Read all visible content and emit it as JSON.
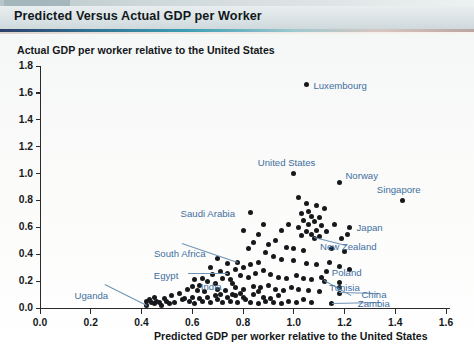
{
  "figure": {
    "strip_tag": "FIGURE 8.4",
    "title": "Predicted Versus Actual GDP per Worker"
  },
  "colors": {
    "title_bar": "#dde5e7",
    "rule_accent": "#3e9fb5",
    "dot": "#16181b",
    "annotation": "#3f6f9f",
    "axis": "#2b2b2b"
  },
  "chart_data": {
    "type": "scatter",
    "title": "Predicted Versus Actual GDP per Worker",
    "xlabel": "Predicted GDP per worker relative to the United States",
    "ylabel": "Actual GDP per worker relative to the United States",
    "xlim": [
      0.0,
      1.6
    ],
    "ylim": [
      0.0,
      1.8
    ],
    "xticks": [
      "0.0",
      "0.2",
      "0.4",
      "0.6",
      "0.8",
      "1.0",
      "1.2",
      "1.4",
      "1.6"
    ],
    "yticks": [
      "0.0",
      "0.2",
      "0.4",
      "0.6",
      "0.8",
      "1.0",
      "1.2",
      "1.4",
      "1.6",
      "1.8"
    ],
    "grid": false,
    "legend": null,
    "labeled_points": [
      {
        "name": "Luxembourg",
        "x": 1.05,
        "y": 1.66,
        "label_dx": 7,
        "label_dy": -5,
        "anchor": "left"
      },
      {
        "name": "United States",
        "x": 1.0,
        "y": 1.0,
        "label_dx": -36,
        "label_dy": -17,
        "anchor": "left"
      },
      {
        "name": "Norway",
        "x": 1.18,
        "y": 0.93,
        "label_dx": 6,
        "label_dy": -13,
        "anchor": "left"
      },
      {
        "name": "Singapore",
        "x": 1.43,
        "y": 0.8,
        "label_dx": -26,
        "label_dy": -16,
        "anchor": "left"
      },
      {
        "name": "Japan",
        "x": 1.22,
        "y": 0.6,
        "label_dx": 7,
        "label_dy": -5,
        "anchor": "left"
      },
      {
        "name": "New Zealand",
        "x": 1.08,
        "y": 0.52,
        "label_dx": 6,
        "label_dy": 3,
        "anchor": "left"
      },
      {
        "name": "Saudi Arabia",
        "x": 0.83,
        "y": 0.71,
        "label_dx": -70,
        "label_dy": -5,
        "anchor": "left"
      },
      {
        "name": "South Africa",
        "x": 0.78,
        "y": 0.34,
        "label_dx": -84,
        "label_dy": -14,
        "anchor": "left"
      },
      {
        "name": "Egypt",
        "x": 0.74,
        "y": 0.26,
        "label_dx": -74,
        "label_dy": -3,
        "anchor": "left"
      },
      {
        "name": "India",
        "x": 0.76,
        "y": 0.18,
        "label_dx": -32,
        "label_dy": -3,
        "anchor": "left"
      },
      {
        "name": "Poland",
        "x": 1.13,
        "y": 0.27,
        "label_dx": 5,
        "label_dy": -5,
        "anchor": "left"
      },
      {
        "name": "Tunisia",
        "x": 1.12,
        "y": 0.2,
        "label_dx": 5,
        "label_dy": 1,
        "anchor": "left"
      },
      {
        "name": "China",
        "x": 1.18,
        "y": 0.11,
        "label_dx": 22,
        "label_dy": -4,
        "anchor": "left"
      },
      {
        "name": "Zambia",
        "x": 1.15,
        "y": 0.03,
        "label_dx": 26,
        "label_dy": -6,
        "anchor": "left"
      },
      {
        "name": "Uganda",
        "x": 0.42,
        "y": 0.02,
        "label_dx": -72,
        "label_dy": -15,
        "anchor": "left"
      }
    ],
    "points": [
      [
        1.05,
        1.66
      ],
      [
        1.0,
        1.0
      ],
      [
        1.18,
        0.93
      ],
      [
        1.43,
        0.8
      ],
      [
        1.22,
        0.6
      ],
      [
        1.08,
        0.52
      ],
      [
        0.83,
        0.71
      ],
      [
        0.78,
        0.34
      ],
      [
        0.74,
        0.26
      ],
      [
        0.76,
        0.18
      ],
      [
        1.13,
        0.27
      ],
      [
        1.12,
        0.2
      ],
      [
        1.18,
        0.11
      ],
      [
        1.15,
        0.03
      ],
      [
        0.42,
        0.02
      ],
      [
        1.02,
        0.82
      ],
      [
        1.05,
        0.78
      ],
      [
        1.09,
        0.76
      ],
      [
        1.12,
        0.74
      ],
      [
        1.06,
        0.72
      ],
      [
        1.03,
        0.7
      ],
      [
        1.07,
        0.68
      ],
      [
        1.1,
        0.67
      ],
      [
        1.04,
        0.65
      ],
      [
        1.08,
        0.64
      ],
      [
        1.06,
        0.62
      ],
      [
        1.11,
        0.61
      ],
      [
        1.02,
        0.6
      ],
      [
        1.09,
        0.58
      ],
      [
        1.05,
        0.57
      ],
      [
        1.13,
        0.57
      ],
      [
        1.07,
        0.55
      ],
      [
        1.03,
        0.54
      ],
      [
        1.1,
        0.53
      ],
      [
        1.16,
        0.62
      ],
      [
        1.21,
        0.55
      ],
      [
        1.19,
        0.52
      ],
      [
        0.98,
        0.62
      ],
      [
        0.95,
        0.58
      ],
      [
        0.93,
        0.5
      ],
      [
        0.9,
        0.47
      ],
      [
        0.97,
        0.45
      ],
      [
        1.0,
        0.44
      ],
      [
        1.04,
        0.43
      ],
      [
        1.15,
        0.44
      ],
      [
        1.2,
        0.42
      ],
      [
        0.88,
        0.62
      ],
      [
        0.86,
        0.55
      ],
      [
        0.84,
        0.49
      ],
      [
        0.82,
        0.44
      ],
      [
        0.8,
        0.58
      ],
      [
        0.89,
        0.41
      ],
      [
        0.92,
        0.38
      ],
      [
        0.95,
        0.36
      ],
      [
        1.0,
        0.35
      ],
      [
        1.05,
        0.33
      ],
      [
        1.09,
        0.32
      ],
      [
        1.14,
        0.34
      ],
      [
        1.18,
        0.31
      ],
      [
        1.22,
        0.29
      ],
      [
        0.86,
        0.34
      ],
      [
        0.83,
        0.32
      ],
      [
        0.8,
        0.3
      ],
      [
        0.77,
        0.29
      ],
      [
        0.74,
        0.33
      ],
      [
        0.71,
        0.27
      ],
      [
        0.68,
        0.25
      ],
      [
        0.72,
        0.22
      ],
      [
        0.75,
        0.21
      ],
      [
        0.79,
        0.24
      ],
      [
        0.82,
        0.23
      ],
      [
        0.85,
        0.26
      ],
      [
        0.88,
        0.28
      ],
      [
        0.91,
        0.25
      ],
      [
        0.94,
        0.23
      ],
      [
        0.97,
        0.22
      ],
      [
        1.01,
        0.24
      ],
      [
        1.04,
        0.22
      ],
      [
        1.07,
        0.21
      ],
      [
        1.11,
        0.23
      ],
      [
        0.66,
        0.2
      ],
      [
        0.69,
        0.18
      ],
      [
        0.63,
        0.17
      ],
      [
        0.6,
        0.16
      ],
      [
        0.58,
        0.14
      ],
      [
        0.62,
        0.13
      ],
      [
        0.65,
        0.12
      ],
      [
        0.7,
        0.14
      ],
      [
        0.73,
        0.13
      ],
      [
        0.77,
        0.15
      ],
      [
        0.8,
        0.14
      ],
      [
        0.84,
        0.16
      ],
      [
        0.87,
        0.15
      ],
      [
        0.9,
        0.17
      ],
      [
        0.93,
        0.14
      ],
      [
        0.96,
        0.13
      ],
      [
        0.99,
        0.15
      ],
      [
        1.02,
        0.14
      ],
      [
        1.06,
        0.13
      ],
      [
        1.1,
        0.12
      ],
      [
        1.18,
        0.15
      ],
      [
        1.18,
        0.19
      ],
      [
        0.55,
        0.11
      ],
      [
        0.52,
        0.09
      ],
      [
        0.49,
        0.07
      ],
      [
        0.46,
        0.05
      ],
      [
        0.44,
        0.04
      ],
      [
        0.43,
        0.06
      ],
      [
        0.45,
        0.03
      ],
      [
        0.47,
        0.04
      ],
      [
        0.5,
        0.05
      ],
      [
        0.53,
        0.04
      ],
      [
        0.56,
        0.06
      ],
      [
        0.59,
        0.05
      ],
      [
        0.61,
        0.03
      ],
      [
        0.64,
        0.05
      ],
      [
        0.67,
        0.04
      ],
      [
        0.7,
        0.06
      ],
      [
        0.72,
        0.04
      ],
      [
        0.75,
        0.05
      ],
      [
        0.78,
        0.04
      ],
      [
        0.81,
        0.06
      ],
      [
        0.83,
        0.04
      ],
      [
        0.86,
        0.03
      ],
      [
        0.89,
        0.05
      ],
      [
        0.92,
        0.04
      ],
      [
        0.95,
        0.03
      ],
      [
        0.98,
        0.05
      ],
      [
        1.01,
        0.04
      ],
      [
        1.04,
        0.06
      ],
      [
        1.07,
        0.04
      ],
      [
        0.66,
        0.08
      ],
      [
        0.69,
        0.09
      ],
      [
        0.63,
        0.07
      ],
      [
        0.71,
        0.1
      ],
      [
        0.74,
        0.08
      ],
      [
        0.77,
        0.09
      ],
      [
        0.8,
        0.08
      ],
      [
        0.6,
        0.08
      ],
      [
        0.57,
        0.07
      ],
      [
        0.51,
        0.03
      ],
      [
        0.48,
        0.02
      ],
      [
        0.45,
        0.08
      ],
      [
        0.42,
        0.05
      ],
      [
        0.88,
        0.08
      ],
      [
        0.91,
        0.07
      ],
      [
        0.94,
        0.09
      ],
      [
        0.84,
        0.1
      ],
      [
        0.86,
        0.12
      ],
      [
        0.79,
        0.11
      ],
      [
        0.76,
        0.1
      ],
      [
        0.67,
        0.3
      ],
      [
        0.7,
        0.37
      ],
      [
        0.64,
        0.22
      ],
      [
        0.61,
        0.21
      ]
    ]
  }
}
